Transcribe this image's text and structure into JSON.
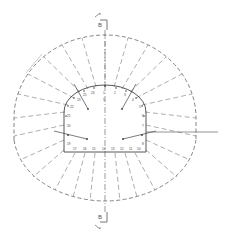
{
  "diagram": {
    "type": "tunnel-cross-section-drilling-pattern",
    "colors": {
      "line": "#555555",
      "background": "#ffffff",
      "light_line": "#bbbbbb"
    },
    "section_marker_top": {
      "label": "B"
    },
    "section_marker_bottom": {
      "label": "B"
    },
    "hole_labels_crown": [
      "24",
      "25",
      "1",
      "2",
      "3"
    ],
    "hole_labels_left_wall": [
      "23",
      "22",
      "21",
      "20",
      "19"
    ],
    "hole_labels_right_wall": [
      "4",
      "5",
      "6",
      "7",
      "8"
    ],
    "hole_labels_floor": [
      "17",
      "16",
      "15",
      "14",
      "13",
      "12",
      "11",
      "10"
    ],
    "center_label": "5"
  }
}
